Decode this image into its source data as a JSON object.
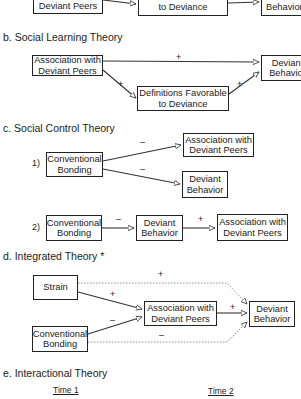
{
  "section_a": {
    "boxes": [
      "Deviant Peers",
      "to Deviance",
      "Behavior"
    ]
  },
  "section_b": {
    "heading": "b.  Social Learning Theory",
    "boxes": {
      "peers": "Association with Deviant Peers",
      "definitions": "Definitions Favorable to Deviance",
      "behavior": "Deviant Behavior"
    },
    "signs": {
      "peers_behavior": "+",
      "peers_definitions": "+",
      "definitions_behavior": "+"
    }
  },
  "section_c": {
    "heading": "c.  Social Control Theory",
    "model1": {
      "label": "1)",
      "boxes": {
        "bonding": "Conventional Bonding",
        "peers": "Association with Deviant Peers",
        "behavior": "Deviant Behavior"
      },
      "signs": {
        "bonding_peers": "–",
        "bonding_behavior": "–"
      }
    },
    "model2": {
      "label": "2)",
      "boxes": {
        "bonding": "Conventional Bonding",
        "behavior": "Deviant Behavior",
        "peers": "Association with Deviant Peers"
      },
      "signs": {
        "bonding_behavior": "–",
        "behavior_peers": "+"
      }
    }
  },
  "section_d": {
    "heading": "d.  Integrated Theory *",
    "boxes": {
      "strain": "Strain",
      "bonding": "Conventional Bonding",
      "peers": "Association with Deviant Peers",
      "behavior": "Deviant Behavior"
    },
    "signs": {
      "strain_behavior": "+",
      "strain_peers": "+",
      "bonding_peers": "–",
      "peers_behavior": "+",
      "bonding_behavior": "–"
    }
  },
  "section_e": {
    "heading": "e.  Interactional Theory",
    "time1": "Time 1",
    "time2": "Time 2"
  }
}
